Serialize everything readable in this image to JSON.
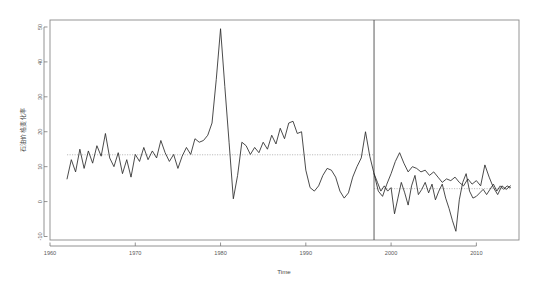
{
  "chart_data": {
    "type": "line",
    "title": "",
    "subtitle": "",
    "xlabel": "Time",
    "ylabel": "石油价格变化率",
    "xlim": [
      1960,
      2015
    ],
    "ylim": [
      -11,
      52
    ],
    "xticks": [
      1960,
      1970,
      1980,
      1990,
      2000,
      2010
    ],
    "xticklabels": [
      "1960",
      "1970",
      "1980",
      "1990",
      "2000",
      "2010"
    ],
    "yticks": [
      -10,
      0,
      10,
      20,
      30,
      40,
      50
    ],
    "yticklabels": [
      "-10",
      "0",
      "10",
      "20",
      "30",
      "40",
      "50"
    ],
    "grid": false,
    "legend": "none",
    "annotations": [
      {
        "name": "structural-break-vline",
        "type": "vline",
        "x": 1998.0,
        "style": "solid",
        "color": "#4a4a4a"
      },
      {
        "name": "segment-mean-pre-break",
        "type": "hline-segment",
        "y": 13.4,
        "x_start": 1962.0,
        "x_end": 1998.0,
        "style": "dotted",
        "color": "#9a9a9a"
      },
      {
        "name": "segment-mean-post-break",
        "type": "hline-segment",
        "y": 3.7,
        "x_start": 1998.0,
        "x_end": 2014.0,
        "style": "dotted",
        "color": "#9a9a9a"
      }
    ],
    "series": [
      {
        "name": "石油价格变化率",
        "color": "#2b2b2b",
        "x": [
          1962.0,
          1962.5,
          1963.0,
          1963.5,
          1964.0,
          1964.5,
          1965.0,
          1965.5,
          1966.0,
          1966.5,
          1967.0,
          1967.5,
          1968.0,
          1968.5,
          1969.0,
          1969.5,
          1970.0,
          1970.5,
          1971.0,
          1971.5,
          1972.0,
          1972.5,
          1973.0,
          1973.5,
          1974.0,
          1974.5,
          1975.0,
          1975.5,
          1976.0,
          1976.5,
          1977.0,
          1977.5,
          1978.0,
          1978.5,
          1979.0,
          1979.5,
          1980.0,
          1980.5,
          1981.0,
          1981.5,
          1982.0,
          1982.5,
          1983.0,
          1983.5,
          1984.0,
          1984.5,
          1985.0,
          1985.5,
          1986.0,
          1986.5,
          1987.0,
          1987.5,
          1988.0,
          1988.5,
          1989.0,
          1989.5,
          1990.0,
          1990.5,
          1991.0,
          1991.5,
          1992.0,
          1992.5,
          1993.0,
          1993.5,
          1994.0,
          1994.5,
          1995.0,
          1995.5,
          1996.0,
          1996.5,
          1997.0,
          1997.5,
          1998.0,
          1998.5,
          1999.0,
          1999.5,
          2000.0,
          2000.5,
          2001.0,
          2001.5,
          2002.0,
          2002.5,
          2003.0,
          2003.5,
          2004.0,
          2004.5,
          2005.0,
          2005.5,
          2006.0,
          2006.5,
          2007.0,
          2007.5,
          2008.0,
          2008.5,
          2009.0,
          2009.5,
          2010.0,
          2010.5,
          2011.0,
          2011.5,
          2012.0,
          2012.5,
          2013.0,
          2013.5,
          2014.0
        ],
        "y": [
          6.5,
          12.0,
          8.5,
          15.0,
          9.5,
          14.5,
          11.0,
          16.0,
          13.0,
          19.5,
          12.5,
          10.0,
          14.0,
          8.0,
          12.0,
          7.0,
          13.5,
          11.5,
          15.5,
          12.0,
          14.5,
          12.5,
          17.5,
          14.0,
          11.5,
          13.5,
          9.5,
          13.0,
          15.5,
          13.5,
          18.0,
          17.0,
          17.5,
          19.0,
          22.5,
          35.0,
          49.5,
          33.0,
          17.0,
          0.8,
          7.5,
          17.0,
          16.0,
          13.5,
          15.5,
          14.0,
          17.0,
          15.0,
          19.0,
          16.5,
          21.0,
          18.0,
          22.5,
          23.0,
          19.5,
          20.0,
          9.0,
          4.0,
          3.0,
          4.5,
          7.5,
          9.5,
          9.0,
          7.0,
          3.0,
          1.0,
          2.5,
          7.0,
          10.0,
          12.5,
          20.0,
          13.0,
          8.0,
          3.0,
          1.5,
          5.0,
          8.0,
          11.5,
          14.0,
          11.0,
          8.5,
          10.0,
          9.5,
          8.5,
          9.0,
          7.5,
          8.5,
          7.0,
          5.5,
          6.5,
          6.0,
          7.0,
          5.5,
          4.5,
          6.5,
          5.0,
          6.0,
          4.5,
          10.5,
          7.0,
          4.0,
          2.0,
          4.5,
          3.5,
          4.5
        ]
      },
      {
        "name": "石油价格变化率-post-break",
        "color": "#2b2b2b",
        "x": [
          1998.0,
          1998.4,
          1998.8,
          1999.2,
          1999.6,
          2000.0,
          2000.4,
          2000.8,
          2001.2,
          2001.6,
          2002.0,
          2002.4,
          2002.8,
          2003.2,
          2003.6,
          2004.0,
          2004.4,
          2004.8,
          2005.2,
          2005.6,
          2006.0,
          2006.4,
          2006.8,
          2007.2,
          2007.6,
          2008.0,
          2008.4,
          2008.8,
          2009.2,
          2009.6,
          2010.0,
          2010.4,
          2010.8,
          2011.2,
          2011.6,
          2012.0,
          2012.4,
          2012.8,
          2013.2,
          2013.6,
          2014.0
        ],
        "y": [
          8.0,
          5.5,
          3.0,
          4.5,
          3.0,
          4.0,
          -3.5,
          1.0,
          5.5,
          2.5,
          -1.0,
          4.5,
          7.5,
          2.0,
          3.5,
          5.5,
          2.5,
          5.0,
          0.5,
          3.0,
          5.0,
          1.0,
          -2.0,
          -5.5,
          -8.5,
          0.5,
          5.5,
          8.0,
          3.0,
          1.0,
          1.5,
          2.5,
          3.5,
          2.0,
          3.5,
          5.0,
          3.0,
          4.5,
          3.5,
          4.5,
          4.0
        ]
      }
    ]
  },
  "plot_geometry": {
    "frame_left": 50,
    "frame_right": 519,
    "frame_top": 20,
    "frame_bottom": 240
  }
}
